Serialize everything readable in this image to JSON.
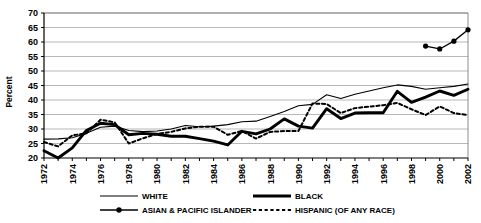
{
  "chart_data": {
    "type": "line",
    "title": "",
    "xlabel": "",
    "ylabel": "Percent",
    "ylim": [
      20,
      70
    ],
    "ytick_step": 5,
    "yticks": [
      20,
      25,
      30,
      35,
      40,
      45,
      50,
      55,
      60,
      65,
      70
    ],
    "xlim": [
      1972,
      2002
    ],
    "xticks": [
      1972,
      1973,
      1974,
      1975,
      1976,
      1977,
      1978,
      1979,
      1980,
      1981,
      1982,
      1983,
      1984,
      1985,
      1986,
      1987,
      1988,
      1989,
      1990,
      1991,
      1992,
      1993,
      1994,
      1995,
      1996,
      1997,
      1998,
      1999,
      2000,
      2001,
      2002
    ],
    "xtick_labels": [
      "1972",
      "1974",
      "1976",
      "1978",
      "1980",
      "1982",
      "1984",
      "1986",
      "1988",
      "1990",
      "1992",
      "1994",
      "1996",
      "1998",
      "2000",
      "2002"
    ],
    "xtick_labeled_years": [
      1972,
      1974,
      1976,
      1978,
      1980,
      1982,
      1984,
      1986,
      1988,
      1990,
      1992,
      1994,
      1996,
      1998,
      2000,
      2002
    ],
    "grid": true,
    "grid_axis": "y",
    "legend_position": "bottom",
    "x": [
      1972,
      1973,
      1974,
      1975,
      1976,
      1977,
      1978,
      1979,
      1980,
      1981,
      1982,
      1983,
      1984,
      1985,
      1986,
      1987,
      1988,
      1989,
      1990,
      1991,
      1992,
      1993,
      1994,
      1995,
      1996,
      1997,
      1998,
      1999,
      2000,
      2001,
      2002
    ],
    "series": [
      {
        "name": "WHITE",
        "style": "thin-solid",
        "color": "#000000",
        "x": [
          1972,
          1973,
          1974,
          1975,
          1976,
          1977,
          1978,
          1979,
          1980,
          1981,
          1982,
          1983,
          1984,
          1985,
          1986,
          1987,
          1988,
          1989,
          1990,
          1991,
          1992,
          1993,
          1994,
          1995,
          1996,
          1997,
          1998,
          1999,
          2000,
          2001,
          2002
        ],
        "values": [
          26.5,
          26.6,
          27.0,
          28.5,
          30.6,
          31.0,
          29.5,
          29.1,
          29.3,
          30.0,
          31.2,
          30.8,
          31.0,
          31.5,
          32.5,
          32.7,
          34.3,
          36.0,
          38.0,
          38.5,
          41.8,
          40.5,
          42.0,
          43.1,
          44.2,
          45.2,
          44.7,
          43.7,
          44.2,
          44.7,
          45.5
        ]
      },
      {
        "name": "BLACK",
        "style": "thick-solid",
        "color": "#000000",
        "x": [
          1972,
          1973,
          1974,
          1975,
          1976,
          1977,
          1978,
          1979,
          1980,
          1981,
          1982,
          1983,
          1984,
          1985,
          1986,
          1987,
          1988,
          1989,
          1990,
          1991,
          1992,
          1993,
          1994,
          1995,
          1996,
          1997,
          1998,
          1999,
          2000,
          2001,
          2002
        ],
        "values": [
          22.5,
          20.0,
          23.5,
          29.5,
          32.0,
          31.5,
          28.0,
          28.5,
          28.2,
          27.5,
          27.5,
          26.7,
          25.8,
          24.5,
          29.2,
          28.3,
          30.0,
          33.5,
          31.0,
          30.3,
          37.0,
          33.6,
          35.5,
          35.6,
          35.6,
          43.0,
          39.2,
          41.0,
          43.1,
          41.6,
          43.7
        ]
      },
      {
        "name": "ASIAN & PACIFIC ISLANDER",
        "style": "marker-line",
        "color": "#000000",
        "x": [
          1999,
          2000,
          2001,
          2002
        ],
        "values": [
          58.6,
          57.6,
          60.3,
          64.2
        ]
      },
      {
        "name": "HISPANIC (OF ANY RACE)",
        "style": "dashed",
        "color": "#000000",
        "x": [
          1972,
          1973,
          1974,
          1975,
          1976,
          1977,
          1978,
          1979,
          1980,
          1981,
          1982,
          1983,
          1984,
          1985,
          1986,
          1987,
          1988,
          1989,
          1990,
          1991,
          1992,
          1993,
          1994,
          1995,
          1996,
          1997,
          1998,
          1999,
          2000,
          2001,
          2002
        ],
        "values": [
          25.5,
          24.0,
          27.8,
          28.5,
          33.2,
          32.3,
          25.0,
          26.8,
          28.3,
          29.0,
          30.2,
          30.8,
          30.8,
          28.0,
          29.3,
          26.7,
          29.0,
          29.3,
          29.3,
          38.8,
          38.6,
          35.5,
          37.2,
          37.7,
          38.2,
          39.0,
          36.8,
          34.8,
          37.8,
          35.5,
          34.8
        ]
      }
    ]
  },
  "legend": {
    "entries": [
      {
        "label": "WHITE",
        "style": "thin-solid"
      },
      {
        "label": "BLACK",
        "style": "thick-solid"
      },
      {
        "label": "ASIAN & PACIFIC ISLANDER",
        "style": "marker-line"
      },
      {
        "label": "HISPANIC (OF ANY RACE)",
        "style": "dashed"
      }
    ]
  },
  "axis": {
    "y_title": "Percent"
  }
}
